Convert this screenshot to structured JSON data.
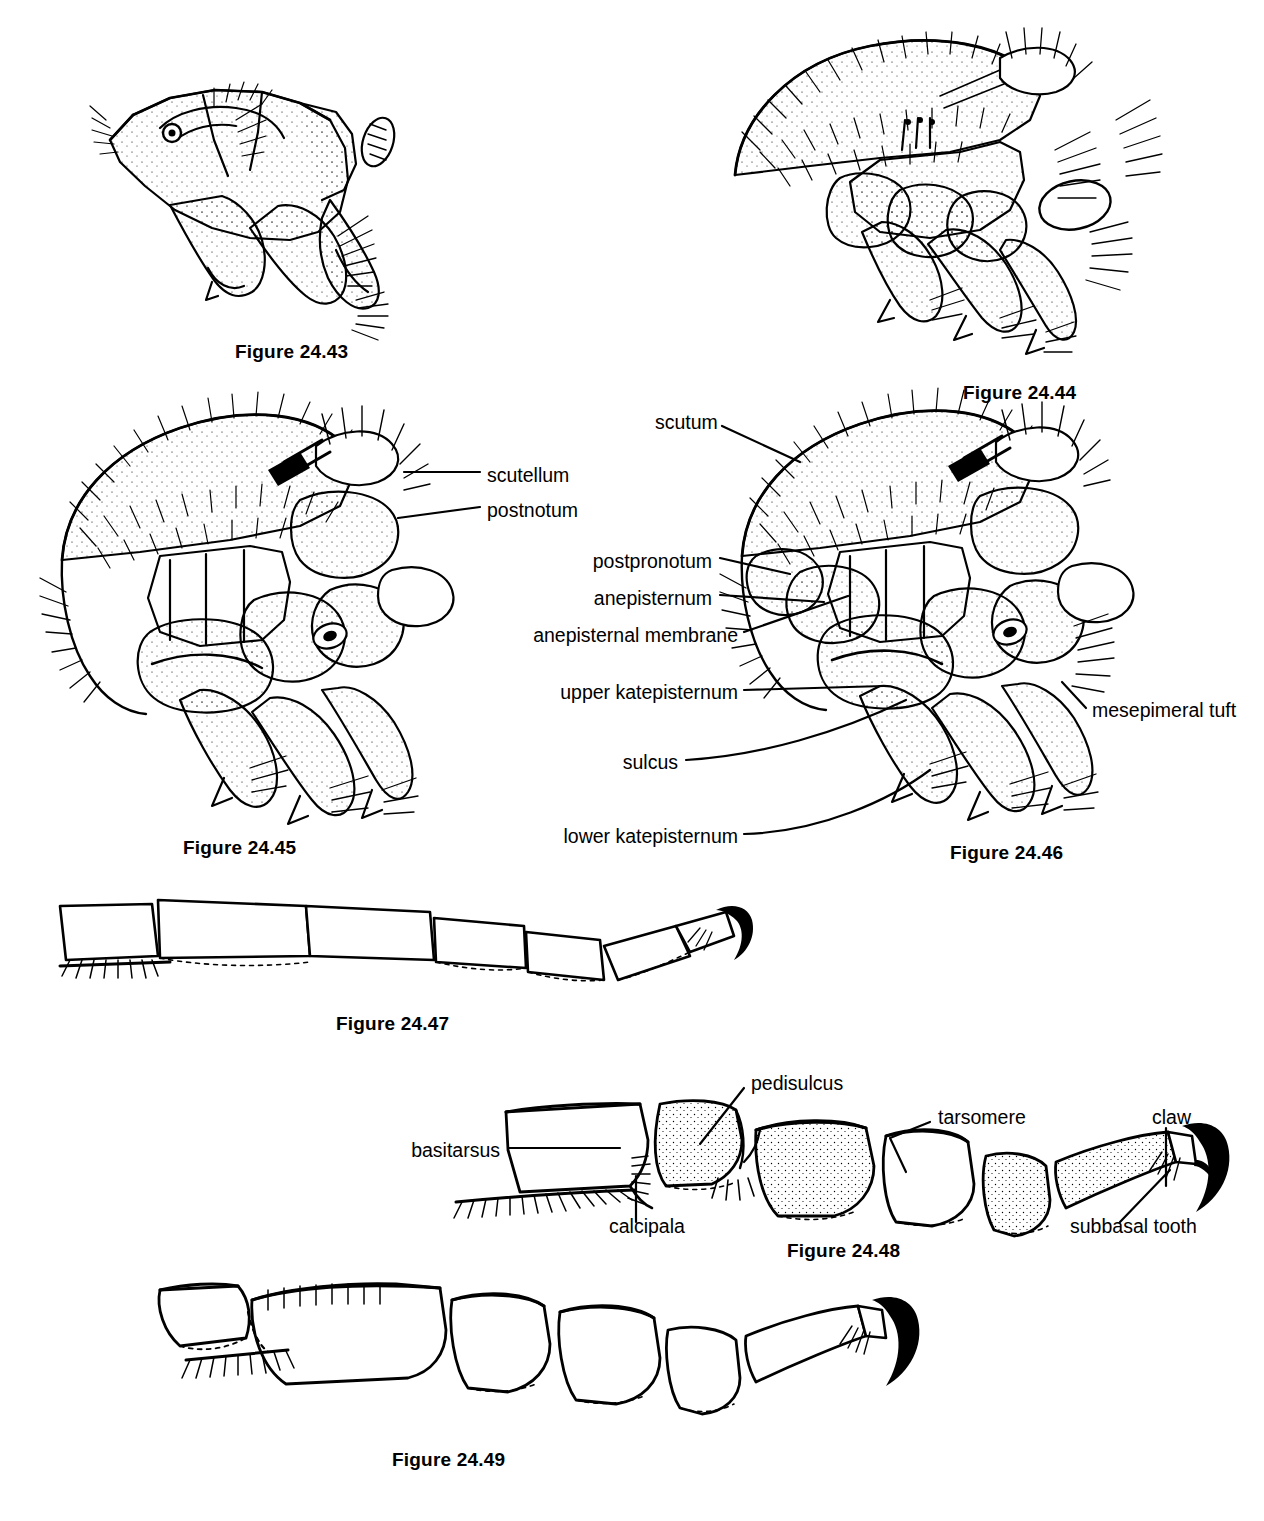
{
  "plate": {
    "width": 1264,
    "height": 1521,
    "background": "#ffffff",
    "ink": "#000000",
    "description": "Plate of black fly (Simuliidae) morphology line drawings: thorax lateral views and legs"
  },
  "figures": [
    {
      "id": "fig-24-43",
      "caption": "Figure 24.43",
      "x": 235,
      "y": 341,
      "subject": "thorax-lateral-view"
    },
    {
      "id": "fig-24-44",
      "caption": "Figure 24.44",
      "x": 963,
      "y": 382,
      "subject": "thorax-lateral-view"
    },
    {
      "id": "fig-24-45",
      "caption": "Figure 24.45",
      "x": 183,
      "y": 837,
      "subject": "thorax-lateral-view-labeled"
    },
    {
      "id": "fig-24-46",
      "caption": "Figure 24.46",
      "x": 950,
      "y": 842,
      "subject": "thorax-lateral-view-labeled"
    },
    {
      "id": "fig-24-47",
      "caption": "Figure 24.47",
      "x": 336,
      "y": 1013,
      "subject": "hind-leg-tarsus"
    },
    {
      "id": "fig-24-48",
      "caption": "Figure 24.48",
      "x": 787,
      "y": 1240,
      "subject": "hind-leg-tarsus-labeled"
    },
    {
      "id": "fig-24-49",
      "caption": "Figure 24.49",
      "x": 392,
      "y": 1449,
      "subject": "hind-leg-tarsus"
    }
  ],
  "annotations": [
    {
      "id": "anno-scutellum",
      "text": "scutellum",
      "x": 487,
      "y": 477,
      "align": "left",
      "figure": "fig-24-45"
    },
    {
      "id": "anno-postnotum",
      "text": "postnotum",
      "x": 487,
      "y": 512,
      "align": "left",
      "figure": "fig-24-45"
    },
    {
      "id": "anno-scutum",
      "text": "scutum",
      "x": 655,
      "y": 424,
      "align": "left",
      "figure": "fig-24-46"
    },
    {
      "id": "anno-postpronotum",
      "text": "postpronotum",
      "x": 712,
      "y": 563,
      "align": "right",
      "figure": "fig-24-46"
    },
    {
      "id": "anno-anepisternum",
      "text": "anepisternum",
      "x": 712,
      "y": 600,
      "align": "right",
      "figure": "fig-24-46"
    },
    {
      "id": "anno-anepisternal-membrane",
      "text": "anepisternal membrane",
      "x": 738,
      "y": 637,
      "align": "right",
      "figure": "fig-24-46"
    },
    {
      "id": "anno-upper-katepisternum",
      "text": "upper katepisternum",
      "x": 738,
      "y": 694,
      "align": "right",
      "figure": "fig-24-46"
    },
    {
      "id": "anno-sulcus",
      "text": "sulcus",
      "x": 678,
      "y": 764,
      "align": "right",
      "figure": "fig-24-46"
    },
    {
      "id": "anno-lower-katepisternum",
      "text": "lower katepisternum",
      "x": 738,
      "y": 838,
      "align": "right",
      "figure": "fig-24-46"
    },
    {
      "id": "anno-mesepimeral-tuft",
      "text": "mesepimeral tuft",
      "x": 1092,
      "y": 712,
      "align": "left",
      "figure": "fig-24-46"
    },
    {
      "id": "anno-pedisulcus",
      "text": "pedisulcus",
      "x": 751,
      "y": 1085,
      "align": "left",
      "figure": "fig-24-48"
    },
    {
      "id": "anno-basitarsus",
      "text": "basitarsus",
      "x": 500,
      "y": 1152,
      "align": "right",
      "figure": "fig-24-48"
    },
    {
      "id": "anno-calcipala",
      "text": "calcipala",
      "x": 609,
      "y": 1228,
      "align": "left",
      "figure": "fig-24-48"
    },
    {
      "id": "anno-tarsomere",
      "text": "tarsomere",
      "x": 938,
      "y": 1119,
      "align": "left",
      "figure": "fig-24-48"
    },
    {
      "id": "anno-claw",
      "text": "claw",
      "x": 1152,
      "y": 1119,
      "align": "left",
      "figure": "fig-24-48"
    },
    {
      "id": "anno-subbasal-tooth",
      "text": "subbasal tooth",
      "x": 1070,
      "y": 1228,
      "align": "left",
      "figure": "fig-24-48"
    }
  ]
}
